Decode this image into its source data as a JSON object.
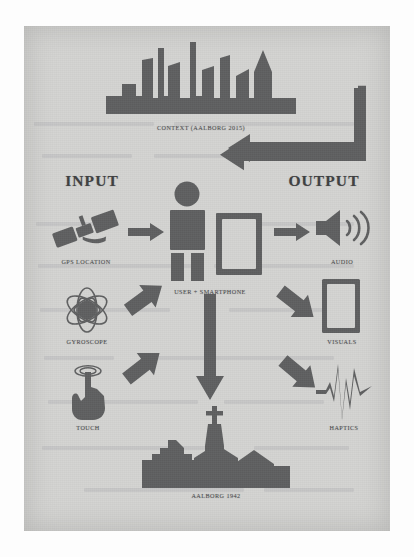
{
  "figure": {
    "background_color": "#d4d4d2",
    "ink_color": "#5f6061",
    "page_color": "#fdfdfd"
  },
  "columns": {
    "input_title": "INPUT",
    "output_title": "OUTPUT"
  },
  "nodes": {
    "context": {
      "label": "CONTEXT (AALBORG 2015)",
      "icon": "city-skyline-icon"
    },
    "center": {
      "label": "USER + SMARTPHONE",
      "user_icon": "person-icon",
      "phone_icon": "smartphone-icon"
    },
    "place": {
      "label": "AALBORG 1942",
      "icon": "church-skyline-icon"
    }
  },
  "inputs": [
    {
      "label": "GPS LOCATION",
      "icon": "satellite-icon"
    },
    {
      "label": "GYROSCOPE",
      "icon": "gyroscope-icon"
    },
    {
      "label": "TOUCH",
      "icon": "touch-hand-icon"
    }
  ],
  "outputs": [
    {
      "label": "AUDIO",
      "icon": "speaker-icon"
    },
    {
      "label": "VISUALS",
      "icon": "screen-icon"
    },
    {
      "label": "HAPTICS",
      "icon": "vibration-waveform-icon"
    }
  ],
  "connectors": [
    {
      "name": "gps-to-user",
      "kind": "arrow-right"
    },
    {
      "name": "gyroscope-to-user",
      "kind": "arrow-up-right"
    },
    {
      "name": "touch-to-user",
      "kind": "arrow-up-right"
    },
    {
      "name": "user-to-audio",
      "kind": "arrow-right"
    },
    {
      "name": "user-to-visuals",
      "kind": "arrow-down-right"
    },
    {
      "name": "user-to-haptics",
      "kind": "arrow-down-right"
    },
    {
      "name": "user-to-place",
      "kind": "arrow-down"
    },
    {
      "name": "output-to-context",
      "kind": "feedback-loop-arrow-left"
    }
  ]
}
